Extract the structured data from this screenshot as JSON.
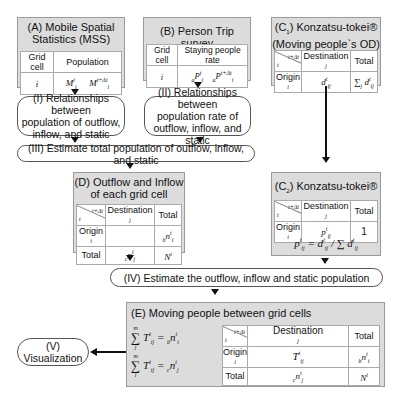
{
  "panelA": {
    "title_line1": "(A) Mobile Spatial",
    "title_line2": "Statistics (MSS)",
    "col1": "Grid cell",
    "col2": "Population",
    "row_i": "i",
    "m1": "M",
    "m1_sub": "i",
    "m1_sup": "t",
    "m2": "M",
    "m2_sub": "i",
    "m2_sup": "t+Δt",
    "dots": "⋮"
  },
  "panelB": {
    "title": "(B) Person Trip survey",
    "col1": "Grid cell",
    "col2": "Staying people rate",
    "row_i": "i",
    "p1_pre": "a",
    "p1": "P",
    "p1_sub": "i",
    "p1_sup": "t",
    "p2_pre": "a",
    "p2": "P",
    "p2_sub": "i",
    "p2_sup": "t+Δt",
    "dots": "⋮"
  },
  "panelC1": {
    "title_line1": "(C",
    "title_sub": "1",
    "title_line1_rest": ") Konzatsu-tokei®",
    "title_line2": "(Moving people`s OD)",
    "corner_top": "t+Δt",
    "corner_bottom": "t",
    "dest": "Destination",
    "dest_j": "j",
    "total": "Total",
    "origin": "Origin",
    "origin_i": "i",
    "cell": "d",
    "cell_sub": "ij",
    "cell_sup": "t",
    "sum": "∑",
    "sum_sub": "j",
    "sum_term": "d",
    "sum_term_sub": "ij",
    "sum_term_sup": "t"
  },
  "panelC2": {
    "title_pre": "(C",
    "title_sub": "2",
    "title_rest": ") Konzatsu-tokei®",
    "corner_top": "t+Δt",
    "corner_bottom": "t",
    "dest": "Destination",
    "dest_j": "j",
    "total": "Total",
    "origin": "Origin",
    "origin_i": "i",
    "cell": "p",
    "cell_sub": "ij",
    "cell_sup": "t",
    "total_val": "1",
    "formula": "p",
    "formula_rest": " =  d",
    "formula_div": " / ∑ d",
    "formula_sub_j": "j"
  },
  "panelD": {
    "title_line1": "(D) Outflow and Inflow",
    "title_line2": "of each grid cell",
    "corner_top": "t+Δt",
    "corner_bottom": "t",
    "dest": "Destination",
    "dest_j": "j",
    "total": "Total",
    "origin": "Origin",
    "origin_i": "i",
    "row_total": "Total",
    "out_pre": "b",
    "out": "n",
    "out_sub": "i",
    "out_sup": "t",
    "in_pre": "c",
    "in": "n",
    "in_sub": "j",
    "in_sup": "t",
    "grand": "N",
    "grand_sup": "t"
  },
  "panelE": {
    "title": "(E) Moving people between grid cells",
    "eq1_sum": "∑",
    "eq1_top": "m",
    "eq1_bottom": "j",
    "eq1_term": "T",
    "eq1_sub": "ij",
    "eq1_sup": "t",
    "eq1_rhs_pre": "b",
    "eq1_rhs": "n",
    "eq1_rhs_sub": "i",
    "eq1_rhs_sup": "t",
    "eq2_sum": "∑",
    "eq2_top": "m",
    "eq2_bottom": "i",
    "eq2_term": "T",
    "eq2_sub": "ij",
    "eq2_sup": "t",
    "eq2_rhs_pre": "c",
    "eq2_rhs": "n",
    "eq2_rhs_sub": "j",
    "eq2_rhs_sup": "t",
    "corner_top": "t+Δt",
    "corner_bottom": "t",
    "dest": "Destination",
    "dest_j": "j",
    "total": "Total",
    "origin": "Origin",
    "origin_i": "i",
    "row_total": "Total",
    "cell": "T",
    "cell_sub": "ij",
    "cell_sup": "t",
    "out_pre": "b",
    "out": "n",
    "out_sub": "i",
    "out_sup": "t",
    "in_pre": "c",
    "in": "n",
    "in_sub": "j",
    "in_sup": "t",
    "grand": "N",
    "grand_sup": "t"
  },
  "steps": {
    "I": [
      "(I) Relationships between",
      "population of outflow,",
      "inflow, and static"
    ],
    "II": [
      "(II) Relationships between",
      "population rate of",
      "outflow, inflow, and static"
    ],
    "III": "(III) Estimate total population of outflow, inflow, and static",
    "IV": "(IV) Estimate the outflow, inflow and static population",
    "V": [
      "(V)",
      "Visualization"
    ]
  }
}
